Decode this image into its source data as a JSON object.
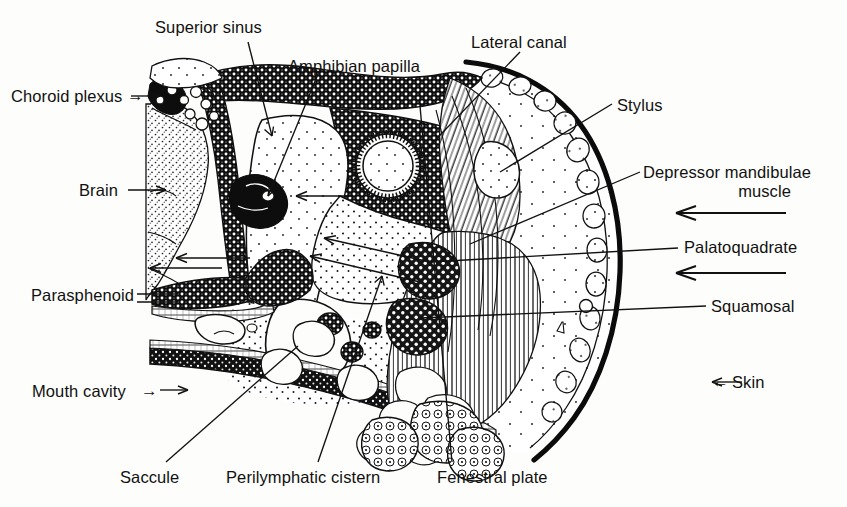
{
  "figure": {
    "background_color": "#fdfdfb",
    "ink_color": "#111111",
    "width": 847,
    "height": 507
  },
  "labels": {
    "superior_sinus": "Superior sinus",
    "amphibian_papilla": "Amphibian papilla",
    "lateral_canal": "Lateral canal",
    "choroid_plexus": "Choroid plexus",
    "brain": "Brain",
    "parasphenoid": "Parasphenoid",
    "mouth_cavity": "Mouth cavity",
    "saccule": "Saccule",
    "perilymphatic_cistern": "Perilymphatic cistern",
    "fenestral_plate": "Fenestral plate",
    "stylus": "Stylus",
    "depressor_mandibulae_line1": "Depressor mandibulae",
    "depressor_mandibulae_line2": "muscle",
    "palatoquadrate": "Palatoquadrate",
    "squamosal": "Squamosal",
    "skin": "Skin"
  },
  "arrow_glyphs": {
    "right_arrow": "→",
    "left_arrow": "←"
  },
  "structures": [
    {
      "name": "brain",
      "fill": "fine-stipple"
    },
    {
      "name": "choroid-plexus",
      "fill": "dense-black-blobs"
    },
    {
      "name": "superior-sinus",
      "fill": "open"
    },
    {
      "name": "otic-capsule-bone",
      "fill": "coarse-stipple-dark"
    },
    {
      "name": "perilymphatic-cistern",
      "fill": "medium-stipple"
    },
    {
      "name": "saccule",
      "fill": "open"
    },
    {
      "name": "amphibian-papilla",
      "fill": "dense-black"
    },
    {
      "name": "lateral-canal",
      "fill": "ring"
    },
    {
      "name": "parasphenoid",
      "fill": "coarse-stipple-dark"
    },
    {
      "name": "mouth-cavity-epithelium",
      "fill": "dark-band"
    },
    {
      "name": "depressor-mandibulae-muscle",
      "fill": "fiber-hatching"
    },
    {
      "name": "palatoquadrate",
      "fill": "coarse-stipple-dark"
    },
    {
      "name": "squamosal",
      "fill": "coarse-stipple-dark"
    },
    {
      "name": "fenestral-plate",
      "fill": "coarse-stipple-dark"
    },
    {
      "name": "stylus",
      "fill": "coarse-stipple-dark"
    },
    {
      "name": "skin",
      "fill": "outline-with-glands"
    }
  ]
}
